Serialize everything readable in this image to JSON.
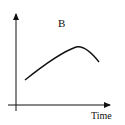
{
  "diagram": {
    "title_label": "B",
    "x_axis_label": "Time",
    "y_axis_label": "",
    "curve": {
      "description": "rising curve that peaks and then declines",
      "points": [
        [
          25,
          80
        ],
        [
          40,
          68
        ],
        [
          55,
          58
        ],
        [
          70,
          49
        ],
        [
          77,
          47
        ],
        [
          85,
          49
        ],
        [
          92,
          55
        ],
        [
          99,
          62
        ]
      ]
    },
    "colors": {
      "line": "#111111",
      "background": "#ffffff"
    }
  }
}
